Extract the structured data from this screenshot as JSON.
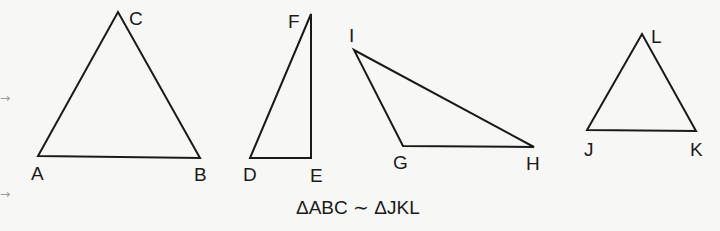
{
  "triangles": [
    {
      "name": "ABC",
      "vertices": {
        "A": [
          38,
          156
        ],
        "B": [
          200,
          158
        ],
        "C": [
          118,
          12
        ]
      },
      "labels": [
        {
          "text": "A",
          "x": 31,
          "y": 180
        },
        {
          "text": "B",
          "x": 194,
          "y": 181
        },
        {
          "text": "C",
          "x": 129,
          "y": 25
        }
      ]
    },
    {
      "name": "DEF",
      "vertices": {
        "D": [
          250,
          158
        ],
        "E": [
          311,
          158
        ],
        "F": [
          311,
          14
        ]
      },
      "labels": [
        {
          "text": "D",
          "x": 243,
          "y": 181
        },
        {
          "text": "E",
          "x": 310,
          "y": 182
        },
        {
          "text": "F",
          "x": 288,
          "y": 28
        }
      ]
    },
    {
      "name": "GHI",
      "vertices": {
        "G": [
          403,
          146
        ],
        "H": [
          534,
          147
        ],
        "I": [
          354,
          50
        ]
      },
      "labels": [
        {
          "text": "G",
          "x": 393,
          "y": 169
        },
        {
          "text": "H",
          "x": 526,
          "y": 170
        },
        {
          "text": "I",
          "x": 349,
          "y": 42
        }
      ]
    },
    {
      "name": "JKL",
      "vertices": {
        "J": [
          587,
          130
        ],
        "K": [
          696,
          131
        ],
        "L": [
          642,
          34
        ]
      },
      "labels": [
        {
          "text": "J",
          "x": 584,
          "y": 156
        },
        {
          "text": "K",
          "x": 690,
          "y": 156
        },
        {
          "text": "L",
          "x": 651,
          "y": 43
        }
      ]
    }
  ],
  "caption": "ΔABC ∼ ΔJKL",
  "margin_arrows": [
    "→",
    "→"
  ],
  "colors": {
    "stroke": "#1a1a1a",
    "background": "#f7f7f5",
    "arrow": "#9a9a9a"
  }
}
